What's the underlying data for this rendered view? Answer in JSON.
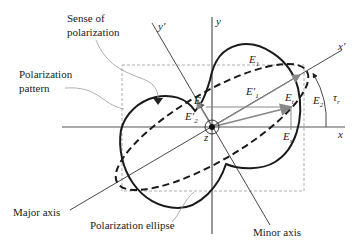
{
  "figure": {
    "labels": {
      "sense_of_polarization_line1": "Sense of",
      "sense_of_polarization_line2": "polarization",
      "polarization_pattern_line1": "Polarization",
      "polarization_pattern_line2": "pattern",
      "major_axis": "Major axis",
      "polarization_ellipse": "Polarization ellipse",
      "minor_axis": "Minor axis"
    },
    "axes": {
      "x": "x",
      "y": "y",
      "x_prime": "x′",
      "y_prime": "y′",
      "z": "z"
    },
    "vectors": {
      "E1": "E",
      "E1_sub": "1",
      "E2": "E",
      "E2_sub": "2",
      "E1_prime": "E′",
      "E1_prime_sub": "1",
      "E2_prime": "E′",
      "E2_prime_sub": "2",
      "Ex": "E",
      "Ex_sub": "x",
      "Ey": "E",
      "Ey_sub": "y",
      "Et": "E",
      "Et_sub": "t",
      "tau": "τ",
      "tau_sub": "r"
    },
    "colors": {
      "curve": "#1a1a1a",
      "axis": "#333333",
      "vector": "#888888",
      "dashed_box": "#999999"
    }
  }
}
